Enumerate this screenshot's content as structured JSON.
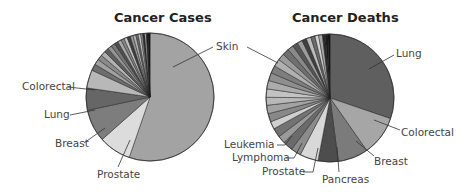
{
  "chart_data": [
    {
      "type": "pie",
      "title": "Cancer Cases",
      "labeled_slices": [
        "Skin",
        "Prostate",
        "Breast",
        "Lung",
        "Colorectal"
      ],
      "slices": [
        {
          "label": "Skin",
          "value": 54.0,
          "color": "#a3a3a3"
        },
        {
          "label": "Prostate",
          "value": 8.0,
          "color": "#dcdcdc"
        },
        {
          "label": "Breast",
          "value": 8.0,
          "color": "#7d7d7d"
        },
        {
          "label": "Lung",
          "value": 5.5,
          "color": "#666666"
        },
        {
          "label": "Colorectal",
          "value": 4.5,
          "color": "#b8b8b8"
        },
        {
          "label": "",
          "value": 1.6,
          "color": "#6e6e6e"
        },
        {
          "label": "",
          "value": 1.4,
          "color": "#a0a0a0"
        },
        {
          "label": "",
          "value": 1.3,
          "color": "#8a8a8a"
        },
        {
          "label": "",
          "value": 1.2,
          "color": "#b0b0b0"
        },
        {
          "label": "",
          "value": 1.1,
          "color": "#5e5e5e"
        },
        {
          "label": "",
          "value": 1.0,
          "color": "#959595"
        },
        {
          "label": "",
          "value": 1.0,
          "color": "#777777"
        },
        {
          "label": "",
          "value": 0.9,
          "color": "#4f4f4f"
        },
        {
          "label": "",
          "value": 0.9,
          "color": "#a8a8a8"
        },
        {
          "label": "",
          "value": 0.8,
          "color": "#858585"
        },
        {
          "label": "",
          "value": 0.8,
          "color": "#c4c4c4"
        },
        {
          "label": "",
          "value": 0.8,
          "color": "#3e3e3e"
        },
        {
          "label": "",
          "value": 0.7,
          "color": "#999999"
        },
        {
          "label": "",
          "value": 0.7,
          "color": "#b5b5b5"
        },
        {
          "label": "",
          "value": 0.6,
          "color": "#6a6a6a"
        },
        {
          "label": "",
          "value": 0.6,
          "color": "#cfcfcf"
        },
        {
          "label": "",
          "value": 0.5,
          "color": "#8f8f8f"
        },
        {
          "label": "",
          "value": 0.5,
          "color": "#2e2e2e"
        },
        {
          "label": "",
          "value": 0.4,
          "color": "#bdbdbd"
        },
        {
          "label": "",
          "value": 0.4,
          "color": "#1e1e1e"
        },
        {
          "label": "",
          "value": 0.5,
          "color": "#111111"
        }
      ]
    },
    {
      "type": "pie",
      "title": "Cancer Deaths",
      "labeled_slices": [
        "Lung",
        "Colorectal",
        "Breast",
        "Pancreas",
        "Prostate",
        "Lymphoma",
        "Leukemia",
        "Skin"
      ],
      "slices": [
        {
          "label": "Lung",
          "value": 28.5,
          "color": "#5f5f5f"
        },
        {
          "label": "Colorectal",
          "value": 9.5,
          "color": "#a6a6a6"
        },
        {
          "label": "Breast",
          "value": 7.2,
          "color": "#7b7b7b"
        },
        {
          "label": "Pancreas",
          "value": 4.8,
          "color": "#4d4d4d"
        },
        {
          "label": "Prostate",
          "value": 4.4,
          "color": "#d8d8d8"
        },
        {
          "label": "",
          "value": 2.4,
          "color": "#8c8c8c"
        },
        {
          "label": "Lymphoma",
          "value": 2.4,
          "color": "#6b6b6b"
        },
        {
          "label": "",
          "value": 1.8,
          "color": "#9a9a9a"
        },
        {
          "label": "Leukemia",
          "value": 2.2,
          "color": "#737373"
        },
        {
          "label": "",
          "value": 1.8,
          "color": "#cfcfcf"
        },
        {
          "label": "",
          "value": 2.0,
          "color": "#888888"
        },
        {
          "label": "",
          "value": 2.0,
          "color": "#a3a3a3"
        },
        {
          "label": "",
          "value": 1.9,
          "color": "#b8b8b8"
        },
        {
          "label": "",
          "value": 2.0,
          "color": "#c2c2c2"
        },
        {
          "label": "",
          "value": 2.0,
          "color": "#acacac"
        },
        {
          "label": "",
          "value": 1.9,
          "color": "#8f8f8f"
        },
        {
          "label": "",
          "value": 1.8,
          "color": "#7e7e7e"
        },
        {
          "label": "Skin",
          "value": 1.8,
          "color": "#b0b0b0"
        },
        {
          "label": "",
          "value": 1.6,
          "color": "#9c9c9c"
        },
        {
          "label": "",
          "value": 1.6,
          "color": "#6f6f6f"
        },
        {
          "label": "",
          "value": 1.4,
          "color": "#8a8a8a"
        },
        {
          "label": "",
          "value": 1.3,
          "color": "#555555"
        },
        {
          "label": "",
          "value": 1.2,
          "color": "#9d9d9d"
        },
        {
          "label": "",
          "value": 1.1,
          "color": "#3f3f3f"
        },
        {
          "label": "",
          "value": 1.1,
          "color": "#bdbdbd"
        },
        {
          "label": "",
          "value": 1.0,
          "color": "#6a6a6a"
        },
        {
          "label": "",
          "value": 0.9,
          "color": "#d0d0d0"
        },
        {
          "label": "",
          "value": 0.9,
          "color": "#a8a8a8"
        },
        {
          "label": "",
          "value": 0.7,
          "color": "#2a2a2a"
        },
        {
          "label": "",
          "value": 0.6,
          "color": "#1a1a1a"
        },
        {
          "label": "",
          "value": 0.5,
          "color": "#111111"
        }
      ]
    }
  ],
  "titles": {
    "cases": "Cancer Cases",
    "deaths": "Cancer Deaths"
  },
  "labels": {
    "cases": {
      "skin": "Skin",
      "colorectal": "Colorectal",
      "lung": "Lung",
      "breast": "Breast",
      "prostate": "Prostate"
    },
    "deaths": {
      "lung": "Lung",
      "colorectal": "Colorectal",
      "breast": "Breast",
      "pancreas": "Pancreas",
      "prostate": "Prostate",
      "lymphoma": "Lymphoma",
      "leukemia": "Leukemia",
      "skin": "Skin"
    }
  }
}
